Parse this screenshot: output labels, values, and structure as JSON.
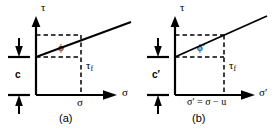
{
  "figure": {
    "line_color": "#000000",
    "background_color": "#ffffff"
  },
  "panels": [
    {
      "id": "a",
      "caption": "(a)",
      "axes": {
        "y_label": "τ",
        "x_label": "σ"
      },
      "labels": {
        "cohesion": "c",
        "friction_angle": "ϕ",
        "shear_strength_base": "τ",
        "shear_strength_sub": "f",
        "normal_stress": "σ"
      }
    },
    {
      "id": "b",
      "caption": "(b)",
      "axes": {
        "y_label": "τ",
        "x_label": "σ′"
      },
      "labels": {
        "cohesion": "c′",
        "friction_angle": "ϕ′",
        "shear_strength_base": "τ",
        "shear_strength_sub": "f",
        "normal_stress": "σ′ = σ − u"
      }
    }
  ]
}
